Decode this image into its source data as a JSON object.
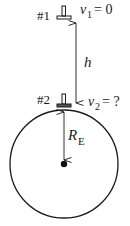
{
  "diagram": {
    "object1": {
      "label": "#1",
      "velocity_symbol": "v",
      "velocity_subscript": "1",
      "velocity_value": "= 0"
    },
    "object2": {
      "label": "#2",
      "velocity_symbol": "v",
      "velocity_subscript": "2",
      "velocity_value": "= ?"
    },
    "height_label": "h",
    "radius_label": {
      "symbol": "R",
      "subscript": "E"
    },
    "colors": {
      "stroke": "#1a1a1a",
      "background": "#ffffff"
    }
  }
}
